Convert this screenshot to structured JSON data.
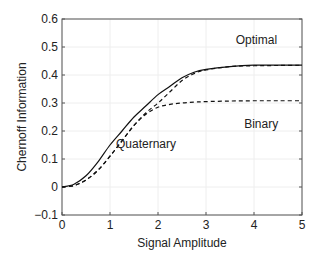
{
  "chart_data": {
    "type": "line",
    "title": "",
    "xlabel": "Signal Amplitude",
    "ylabel": "Chernoff Information",
    "xlim": [
      0,
      5
    ],
    "ylim": [
      -0.1,
      0.6
    ],
    "xticks": [
      "0",
      "1",
      "2",
      "3",
      "4",
      "5"
    ],
    "yticks": [
      "-0.1",
      "0",
      "0.1",
      "0.2",
      "0.3",
      "0.4",
      "0.5",
      "0.6"
    ],
    "grid": true,
    "legend": "inline annotations",
    "x": [
      0,
      0.25,
      0.5,
      0.75,
      1.0,
      1.25,
      1.5,
      1.75,
      2.0,
      2.25,
      2.5,
      2.75,
      3.0,
      3.5,
      4.0,
      4.5,
      5.0
    ],
    "series": [
      {
        "name": "Optimal",
        "style": "solid",
        "values": [
          0,
          0.01,
          0.04,
          0.09,
          0.15,
          0.2,
          0.25,
          0.29,
          0.33,
          0.36,
          0.39,
          0.41,
          0.42,
          0.43,
          0.435,
          0.435,
          0.435
        ]
      },
      {
        "name": "Quaternary",
        "style": "dashed",
        "values": [
          0,
          0.005,
          0.025,
          0.06,
          0.11,
          0.165,
          0.22,
          0.265,
          0.3,
          0.34,
          0.38,
          0.405,
          0.418,
          0.43,
          0.433,
          0.434,
          0.435
        ]
      },
      {
        "name": "Binary",
        "style": "dashed",
        "values": [
          0,
          0.005,
          0.025,
          0.06,
          0.11,
          0.165,
          0.22,
          0.26,
          0.285,
          0.295,
          0.3,
          0.303,
          0.305,
          0.307,
          0.308,
          0.308,
          0.308
        ]
      }
    ],
    "annotations": [
      {
        "text": "Optimal",
        "x": 4.05,
        "y": 0.51
      },
      {
        "text": "Binary",
        "x": 4.15,
        "y": 0.21
      },
      {
        "text": "Quaternary",
        "x": 1.75,
        "y": 0.14
      }
    ]
  }
}
